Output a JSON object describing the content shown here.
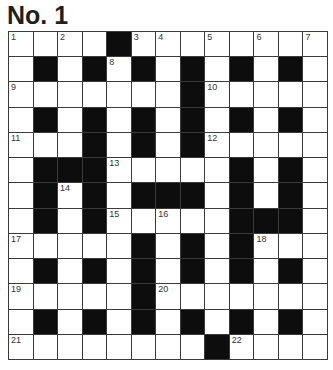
{
  "puzzle": {
    "title": "No. 1",
    "rows": 13,
    "cols": 13,
    "colors": {
      "block": "#0d0d0d",
      "cell": "#ffffff",
      "line": "#3a3a3a",
      "title": "#1f1f1f"
    },
    "grid": [
      "....#........",
      ".#.#.#.#.#.#.",
      ".......#.....",
      ".#.#.#.#.#.#.",
      "...#.#.#.....",
      ".###.....#.#.",
      ".#.#.###.#.#.",
      ".#.#.....###.",
      ".....#.#.#...",
      ".#.#.#.#.#.#.",
      ".....#.......",
      ".#.#.#.#.#.#.",
      "........#...."
    ],
    "numbers": [
      {
        "r": 0,
        "c": 0,
        "n": "1"
      },
      {
        "r": 0,
        "c": 2,
        "n": "2"
      },
      {
        "r": 0,
        "c": 5,
        "n": "3"
      },
      {
        "r": 0,
        "c": 6,
        "n": "4"
      },
      {
        "r": 0,
        "c": 8,
        "n": "5"
      },
      {
        "r": 0,
        "c": 10,
        "n": "6"
      },
      {
        "r": 0,
        "c": 12,
        "n": "7"
      },
      {
        "r": 1,
        "c": 4,
        "n": "8"
      },
      {
        "r": 2,
        "c": 0,
        "n": "9"
      },
      {
        "r": 2,
        "c": 8,
        "n": "10"
      },
      {
        "r": 4,
        "c": 0,
        "n": "11"
      },
      {
        "r": 4,
        "c": 8,
        "n": "12"
      },
      {
        "r": 5,
        "c": 4,
        "n": "13"
      },
      {
        "r": 6,
        "c": 2,
        "n": "14"
      },
      {
        "r": 7,
        "c": 4,
        "n": "15"
      },
      {
        "r": 7,
        "c": 6,
        "n": "16"
      },
      {
        "r": 8,
        "c": 0,
        "n": "17"
      },
      {
        "r": 8,
        "c": 10,
        "n": "18"
      },
      {
        "r": 10,
        "c": 0,
        "n": "19"
      },
      {
        "r": 10,
        "c": 6,
        "n": "20"
      },
      {
        "r": 12,
        "c": 0,
        "n": "21"
      },
      {
        "r": 12,
        "c": 9,
        "n": "22"
      }
    ]
  }
}
